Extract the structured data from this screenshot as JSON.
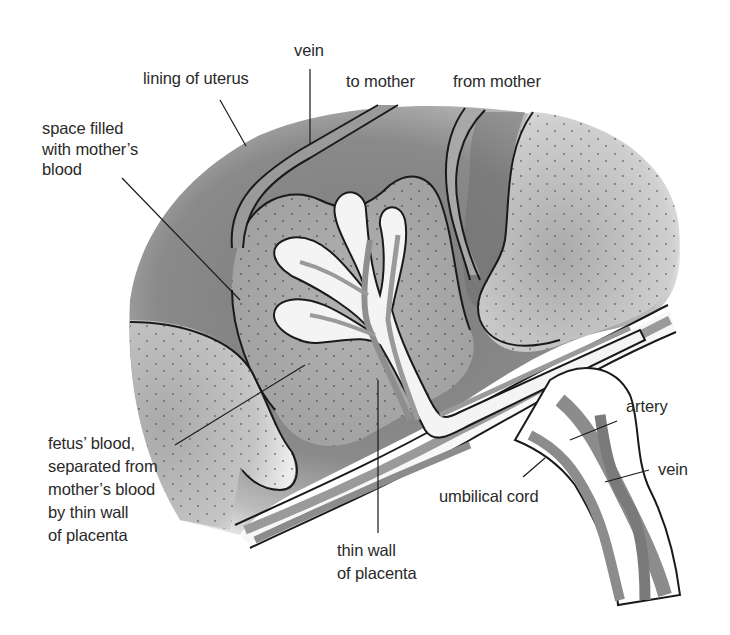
{
  "diagram": {
    "subject": "placenta",
    "colors": {
      "uterus_dark": "#6a6a6a",
      "uterus_mid": "#8e8e8e",
      "blood_space": "#a5a5a5",
      "vessel_fill": "#9a9a9a",
      "wall_white": "#f7f7f7",
      "outline": "#1a1a1a",
      "text": "#2a2a2a"
    },
    "labels": {
      "vein_top": "vein",
      "lining_of_uterus": "lining of uterus",
      "to_mother": "to mother",
      "from_mother": "from mother",
      "space_filled": "space filled\nwith mother’s\nblood",
      "fetus_blood": "fetus’ blood,\nseparated from\nmother’s blood\nby thin wall\nof placenta",
      "thin_wall": "thin wall\nof placenta",
      "umbilical_cord": "umbilical cord",
      "artery": "artery",
      "vein_cord": "vein"
    }
  }
}
